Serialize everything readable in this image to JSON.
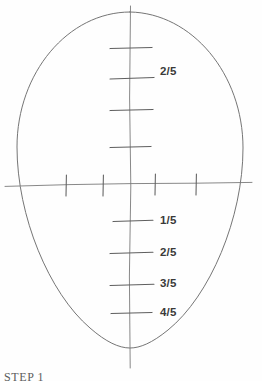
{
  "figure": {
    "caption": "STEP 1",
    "medium": "pencil-sketch",
    "background_color": "#fefefe",
    "line_color": "#6b6b6b",
    "label_color": "#3a3a3a"
  },
  "shapes": {
    "oval": {
      "name": "head-oval",
      "center_x": 130,
      "center_y": 180,
      "radius_x": 113,
      "radius_y": 168,
      "top_y": 12,
      "bottom_y": 348,
      "left_x": 17,
      "right_x": 243
    },
    "vertical_axis": {
      "name": "vertical-centerline",
      "x": 130,
      "top_y": 6,
      "bottom_y": 368
    },
    "horizontal_axis": {
      "name": "horizontal-eyeline",
      "y": 184,
      "left_x": 5,
      "right_x": 252
    }
  },
  "ticks": {
    "vertical_upper": [
      {
        "name": "tick-upper-1",
        "y": 48,
        "label": ""
      },
      {
        "name": "tick-upper-2",
        "y": 78,
        "label": "2/5"
      },
      {
        "name": "tick-upper-3",
        "y": 110,
        "label": ""
      },
      {
        "name": "tick-upper-4",
        "y": 147,
        "label": ""
      }
    ],
    "vertical_lower": [
      {
        "name": "tick-lower-1",
        "y": 221,
        "label": "1/5"
      },
      {
        "name": "tick-lower-2",
        "y": 253,
        "label": "2/5"
      },
      {
        "name": "tick-lower-3",
        "y": 285,
        "label": "3/5"
      },
      {
        "name": "tick-lower-4",
        "y": 313,
        "label": "4/5"
      }
    ],
    "horizontal": [
      {
        "name": "tick-eyeline-1",
        "x": 66
      },
      {
        "name": "tick-eyeline-2",
        "x": 103
      },
      {
        "name": "tick-eyeline-3",
        "x": 155
      },
      {
        "name": "tick-eyeline-4",
        "x": 196
      }
    ]
  },
  "labels": [
    {
      "name": "fraction-label-upper-2-5",
      "text": "2/5",
      "x": 160,
      "y": 66
    },
    {
      "name": "fraction-label-lower-1-5",
      "text": "1/5",
      "x": 160,
      "y": 215
    },
    {
      "name": "fraction-label-lower-2-5",
      "text": "2/5",
      "x": 160,
      "y": 247
    },
    {
      "name": "fraction-label-lower-3-5",
      "text": "3/5",
      "x": 160,
      "y": 278
    },
    {
      "name": "fraction-label-lower-4-5",
      "text": "4/5",
      "x": 160,
      "y": 307
    }
  ]
}
